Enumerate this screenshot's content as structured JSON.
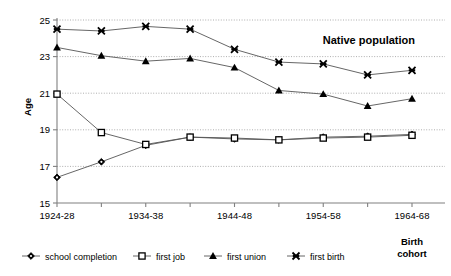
{
  "chart_data": {
    "type": "line",
    "title": "Native population",
    "xlabel": "Birth cohort",
    "ylabel": "Age",
    "ylim": [
      15,
      25
    ],
    "yticks": [
      15,
      17,
      19,
      21,
      23,
      25
    ],
    "grid": true,
    "legend_position": "bottom",
    "categories": [
      "1924-28",
      "1929-33",
      "1934-38",
      "1939-43",
      "1944-48",
      "1949-53",
      "1954-58",
      "1959-63",
      "1964-68"
    ],
    "tick_labels": [
      "1924-28",
      "",
      "1934-38",
      "",
      "1944-48",
      "",
      "1954-58",
      "",
      "1964-68"
    ],
    "series": [
      {
        "name": "school completion",
        "marker": "diamond-filled",
        "values": [
          16.4,
          17.25,
          18.15,
          18.6,
          18.5,
          18.45,
          18.6,
          18.65,
          18.75
        ]
      },
      {
        "name": "first job",
        "marker": "square-open",
        "values": [
          20.95,
          18.85,
          18.2,
          18.6,
          18.55,
          18.45,
          18.55,
          18.6,
          18.7
        ]
      },
      {
        "name": "first union",
        "marker": "triangle-filled",
        "values": [
          23.5,
          23.05,
          22.75,
          22.9,
          22.4,
          21.15,
          20.95,
          20.3,
          20.7
        ]
      },
      {
        "name": "first birth",
        "marker": "x-cross",
        "values": [
          24.5,
          24.4,
          24.65,
          24.5,
          23.4,
          22.7,
          22.6,
          22.0,
          22.25
        ]
      }
    ]
  },
  "legend": {
    "items": [
      {
        "label": "school completion",
        "marker": "diamond-filled"
      },
      {
        "label": "first job",
        "marker": "square-open"
      },
      {
        "label": "first union",
        "marker": "triangle-filled"
      },
      {
        "label": "first birth",
        "marker": "x-cross"
      }
    ]
  },
  "axis_title": {
    "line1": "Birth",
    "line2": "cohort"
  },
  "colors": {
    "line": "#555555",
    "marker": "#000000",
    "grid": "#999999",
    "axis": "#808080",
    "text": "#000000"
  }
}
